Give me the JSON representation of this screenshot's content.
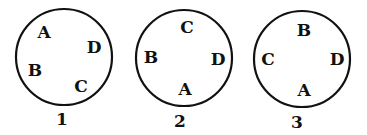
{
  "diagram": {
    "circles": [
      {
        "number": "1",
        "cx": 64,
        "cy": 57,
        "r": 48,
        "number_pos": [
          62,
          125
        ],
        "labels": [
          {
            "text": "A",
            "x": 44,
            "y": 38
          },
          {
            "text": "D",
            "x": 94,
            "y": 53
          },
          {
            "text": "B",
            "x": 35,
            "y": 76
          },
          {
            "text": "C",
            "x": 81,
            "y": 92
          }
        ]
      },
      {
        "number": "2",
        "cx": 184,
        "cy": 58,
        "r": 48,
        "number_pos": [
          180,
          127
        ],
        "labels": [
          {
            "text": "C",
            "x": 187,
            "y": 33
          },
          {
            "text": "B",
            "x": 151,
            "y": 63
          },
          {
            "text": "D",
            "x": 218,
            "y": 65
          },
          {
            "text": "A",
            "x": 185,
            "y": 95
          }
        ]
      },
      {
        "number": "3",
        "cx": 302,
        "cy": 59,
        "r": 48,
        "number_pos": [
          297,
          128
        ],
        "labels": [
          {
            "text": "B",
            "x": 304,
            "y": 36
          },
          {
            "text": "C",
            "x": 268,
            "y": 65
          },
          {
            "text": "D",
            "x": 337,
            "y": 65
          },
          {
            "text": "A",
            "x": 304,
            "y": 96
          }
        ]
      }
    ]
  }
}
